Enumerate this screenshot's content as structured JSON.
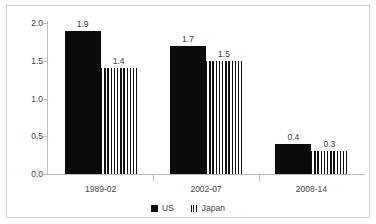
{
  "chart_data": {
    "type": "bar",
    "title": "",
    "subtitle": "",
    "xlabel": "",
    "ylabel": "",
    "categories": [
      "1989-02",
      "2002-07",
      "2008-14"
    ],
    "series": [
      {
        "name": "US",
        "values": [
          1.9,
          1.7,
          0.4
        ],
        "fill": "solid-black",
        "color": "#0a0a0a"
      },
      {
        "name": "Japan",
        "values": [
          1.4,
          1.5,
          0.3
        ],
        "fill": "vertical-stripes",
        "color": "#111111"
      }
    ],
    "value_labels": {
      "US": [
        "1.9",
        "1.7",
        "0.4"
      ],
      "Japan": [
        "1.4",
        "1.5",
        "0.3"
      ]
    },
    "ylim": [
      0.0,
      2.0
    ],
    "ytick_values": [
      0.0,
      0.5,
      1.0,
      1.5,
      2.0
    ],
    "ytick_labels": [
      "0.0",
      "0.5",
      "1.0",
      "1.5",
      "2.0"
    ],
    "grid": false,
    "legend_position": "bottom-center",
    "frame_color": "#d2d2d2",
    "axis_color": "#bdbdbd"
  }
}
